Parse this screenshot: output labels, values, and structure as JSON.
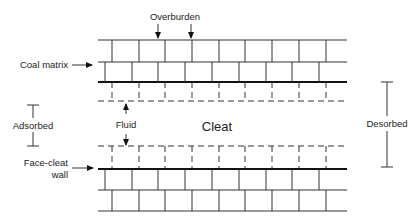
{
  "diagram": {
    "labels": {
      "overburden": "Overburden",
      "coal_matrix": "Coal matrix",
      "adsorbed": "Adsorbed",
      "fluid": "Fluid",
      "cleat": "Cleat",
      "desorbed": "Desorbed",
      "face_cleat_line1": "Face-cleat",
      "face_cleat_line2": "wall"
    },
    "colors": {
      "line": "#333333",
      "text": "#222222",
      "background": "#ffffff"
    }
  }
}
